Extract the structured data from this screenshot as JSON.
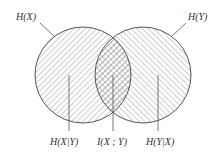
{
  "diagram": {
    "type": "venn",
    "title": "",
    "colors": {
      "stroke": "#555555",
      "hatch": "#888888",
      "text": "#333333",
      "background": "#ffffff"
    },
    "sets": [
      {
        "id": "X",
        "label": "H(X)",
        "hatch": "forward-diagonal"
      },
      {
        "id": "Y",
        "label": "H(Y)",
        "hatch": "backward-diagonal"
      }
    ],
    "regions": [
      {
        "id": "x-only",
        "label": "H(X|Y)"
      },
      {
        "id": "intersection",
        "label": "I(X ; Y)",
        "hatch": "cross-hatch"
      },
      {
        "id": "y-only",
        "label": "H(Y|X)"
      }
    ]
  }
}
